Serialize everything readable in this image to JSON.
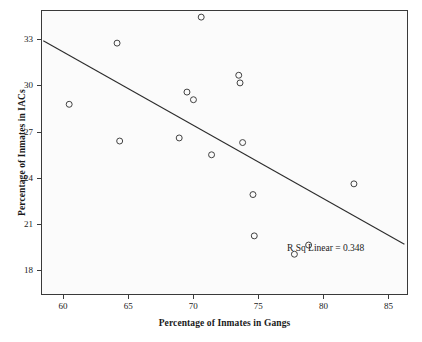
{
  "chart_data": {
    "type": "scatter",
    "title": "",
    "xlabel": "Percentage of Inmates in Gangs",
    "ylabel": "Percentage of Inmates in IACs",
    "xlim": [
      58.3,
      86.5
    ],
    "ylim": [
      16.4,
      34.9
    ],
    "xticks": [
      60,
      65,
      70,
      75,
      80,
      85
    ],
    "yticks": [
      18,
      21,
      24,
      27,
      30,
      33
    ],
    "xtick_labels": [
      "60",
      "65",
      "70",
      "75",
      "80",
      "85"
    ],
    "ytick_labels": [
      "18",
      "21",
      "24",
      "27",
      "30",
      "33"
    ],
    "grid": false,
    "legend": null,
    "points": [
      {
        "x": 60.4,
        "y": 28.8
      },
      {
        "x": 64.1,
        "y": 32.8
      },
      {
        "x": 64.3,
        "y": 26.4
      },
      {
        "x": 68.9,
        "y": 26.6
      },
      {
        "x": 69.5,
        "y": 29.6
      },
      {
        "x": 70.0,
        "y": 29.1
      },
      {
        "x": 70.6,
        "y": 34.5
      },
      {
        "x": 71.4,
        "y": 25.5
      },
      {
        "x": 73.5,
        "y": 30.7
      },
      {
        "x": 73.6,
        "y": 30.2
      },
      {
        "x": 73.8,
        "y": 26.3
      },
      {
        "x": 74.6,
        "y": 22.9
      },
      {
        "x": 74.7,
        "y": 20.2
      },
      {
        "x": 77.8,
        "y": 19.0
      },
      {
        "x": 78.9,
        "y": 19.6
      },
      {
        "x": 82.4,
        "y": 23.6
      }
    ],
    "regression_line": {
      "x_start": 58.4,
      "y_start": 32.95,
      "x_end": 86.3,
      "y_end": 19.65,
      "label": "R Sq Linear = 0.348",
      "r_squared": 0.348
    },
    "marker_style": {
      "shape": "open-circle",
      "radius": 3,
      "stroke_color": "#404040"
    },
    "colors": {
      "plot_background": "#fbfbfb",
      "frame": "#3a3a3a",
      "line": "#2b2b2b",
      "text": "#1a1a1a"
    }
  }
}
